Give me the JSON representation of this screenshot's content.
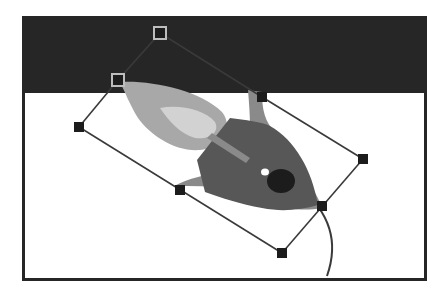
{
  "canvas": {
    "label": "rocket-artwork",
    "background_top": "#262626",
    "background_bottom": "#ffffff",
    "frame_color": "#262626"
  },
  "artwork": {
    "name": "rocket",
    "colors": {
      "body": "#575757",
      "fin": "#8a8a8a",
      "flame_outer": "#a8a8a8",
      "flame_inner": "#d2d2d2",
      "window": "#1c1c1c",
      "highlight": "#ffffff"
    }
  },
  "transform": {
    "handles": [
      {
        "id": "rotate-handle",
        "x": 160,
        "y": 33,
        "style": "outlined"
      },
      {
        "id": "pivot-handle",
        "x": 118,
        "y": 80,
        "style": "outlined"
      },
      {
        "id": "handle-left",
        "x": 79,
        "y": 127,
        "style": "filled"
      },
      {
        "id": "handle-bottom-left-mid",
        "x": 180,
        "y": 190,
        "style": "filled"
      },
      {
        "id": "handle-bottom",
        "x": 282,
        "y": 253,
        "style": "filled"
      },
      {
        "id": "handle-right-mid",
        "x": 322,
        "y": 206,
        "style": "filled"
      },
      {
        "id": "handle-right",
        "x": 363,
        "y": 159,
        "style": "filled"
      },
      {
        "id": "handle-top-right-mid",
        "x": 262,
        "y": 97,
        "style": "filled"
      }
    ],
    "line_color": "#3a3a3a"
  }
}
